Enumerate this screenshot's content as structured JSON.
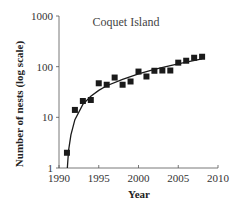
{
  "chart_data": {
    "type": "scatter",
    "title": "Coquet Island",
    "xlabel": "Year",
    "ylabel": "Number of nests (log scale)",
    "xlim": [
      1990,
      2010
    ],
    "ylim": [
      1,
      1000
    ],
    "yscale": "log",
    "grid": false,
    "legend": null,
    "x_ticks": [
      1990,
      1995,
      2000,
      2005,
      2010
    ],
    "y_ticks": [
      1,
      10,
      100,
      1000
    ],
    "x_tick_labels": [
      "1990",
      "1995",
      "2000",
      "2005",
      "2010"
    ],
    "y_tick_labels": [
      "1",
      "10",
      "100",
      "1000"
    ],
    "series": [
      {
        "name": "Observed nests",
        "marker": "square",
        "color": "#1a1a1a",
        "x": [
          1991,
          1992,
          1993,
          1994,
          1995,
          1996,
          1997,
          1998,
          1999,
          2000,
          2001,
          2002,
          2003,
          2004,
          2005,
          2006,
          2007,
          2008
        ],
        "values": [
          2,
          14,
          21,
          22,
          47,
          44,
          61,
          44,
          51,
          80,
          64,
          83,
          84,
          84,
          120,
          131,
          150,
          157
        ]
      },
      {
        "name": "Fitted trend",
        "type": "line",
        "color": "#1a1a1a",
        "x": [
          1991.05,
          1991.2,
          1991.5,
          1992,
          1993,
          1994,
          1995,
          1996,
          1998,
          2000,
          2002,
          2004,
          2006,
          2008
        ],
        "values": [
          1,
          2.2,
          4.5,
          9,
          18,
          26,
          34,
          42,
          56,
          72,
          88,
          105,
          123,
          142
        ]
      }
    ]
  }
}
